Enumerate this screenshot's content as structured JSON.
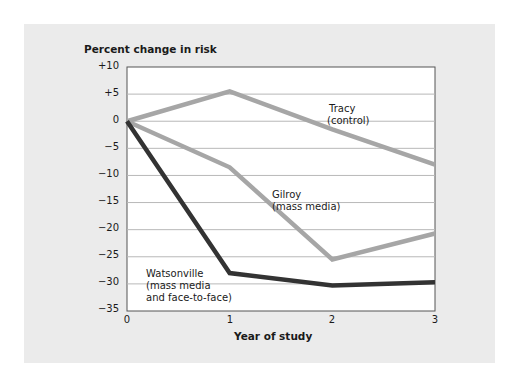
{
  "chart_data": {
    "type": "line",
    "title": "",
    "ylabel": "Percent change in risk",
    "xlabel": "Year of study",
    "x": [
      0,
      1,
      2,
      3
    ],
    "xticks": [
      "0",
      "1",
      "2",
      "3"
    ],
    "yticks": [
      "+10",
      "+5",
      "0",
      "-5",
      "-10",
      "-15",
      "-20",
      "-25",
      "-30",
      "-35"
    ],
    "ylim": [
      -35,
      10
    ],
    "xlim": [
      0,
      3
    ],
    "grid": "horizontal",
    "series": [
      {
        "name": "Tracy (control)",
        "label_lines": [
          "Tracy",
          "(control)"
        ],
        "color": "#a6a6a6",
        "values": [
          0,
          5.5,
          -1.5,
          -8
        ]
      },
      {
        "name": "Gilroy (mass media)",
        "label_lines": [
          "Gilroy",
          "(mass media)"
        ],
        "color": "#a6a6a6",
        "values": [
          0,
          -8.5,
          -25.5,
          -20.7
        ]
      },
      {
        "name": "Watsonville (mass media and face-to-face)",
        "label_lines": [
          "Watsonville",
          "(mass media",
          "and face-to-face)"
        ],
        "color": "#333333",
        "values": [
          0,
          -28,
          -30.3,
          -29.7
        ]
      }
    ]
  },
  "labels": {
    "ylabel": "Percent change in risk",
    "xlabel": "Year of study",
    "yticks": [
      "+10",
      "+5",
      "0",
      "−5",
      "−10",
      "−15",
      "−20",
      "−25",
      "−30",
      "−35"
    ],
    "xticks": [
      "0",
      "1",
      "2",
      "3"
    ],
    "tracy": [
      "Tracy",
      "(control)"
    ],
    "gilroy": [
      "Gilroy",
      "(mass media)"
    ],
    "watsonville": [
      "Watsonville",
      "(mass media",
      "and face-to-face)"
    ]
  }
}
